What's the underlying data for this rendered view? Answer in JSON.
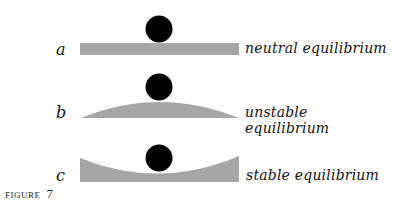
{
  "figure": {
    "label": "FIGURE",
    "number": "7"
  },
  "panels": [
    {
      "letter": "a",
      "caption": "neutral equilibrium",
      "surface": "flat"
    },
    {
      "letter": "b",
      "caption": "unstable equilibrium",
      "surface": "convex"
    },
    {
      "letter": "c",
      "caption": "stable equilibrium",
      "surface": "concave"
    }
  ],
  "colors": {
    "surface": "#a6a6a6",
    "ball": "#000000"
  }
}
